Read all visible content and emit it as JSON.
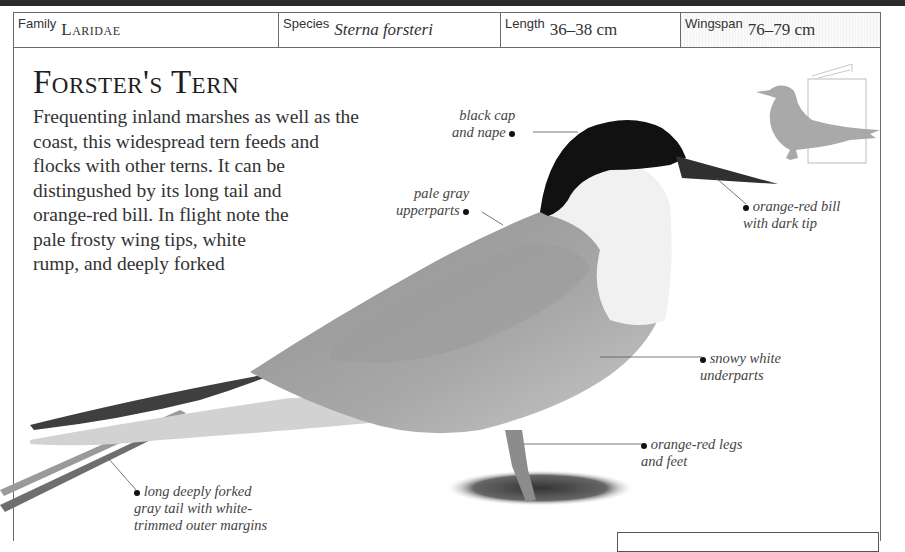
{
  "header": {
    "family_label": "Family",
    "family_value": "Laridae",
    "species_label": "Species",
    "species_value": "Sterna forsteri",
    "length_label": "Length",
    "length_value": "36–38 cm",
    "wingspan_label": "Wingspan",
    "wingspan_value": "76–79 cm"
  },
  "main": {
    "title": "Forster's Tern",
    "description_lines": [
      "Frequenting inland marshes as well as the",
      "coast, this widespread tern feeds and",
      "flocks with other terns. It can be",
      "distingushed by its long tail and",
      "orange-red bill. In flight note the",
      "pale frosty wing tips, white",
      "rump, and deeply forked"
    ]
  },
  "callouts": {
    "cap": [
      "black cap",
      "and nape"
    ],
    "upperparts": [
      "pale gray",
      "upperparts"
    ],
    "bill": [
      "orange-red bill",
      "with dark tip"
    ],
    "underparts": [
      "snowy white",
      "underparts"
    ],
    "legs": [
      "orange-red legs",
      "and feet"
    ],
    "tail": [
      "long deeply forked",
      "gray tail with white-",
      "trimmed outer margins"
    ]
  },
  "icons": {
    "silhouette": "gull-silhouette-icon",
    "scale_book": "book-scale-icon"
  },
  "colors": {
    "topbar": "#2b2b2b",
    "rule": "#6b6b6b",
    "silhouette": "#a9a9a9",
    "cap": "#111111"
  }
}
